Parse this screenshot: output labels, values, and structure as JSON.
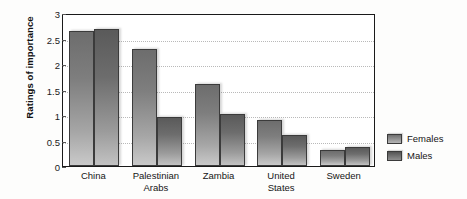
{
  "chart_data": {
    "type": "bar",
    "title": "",
    "xlabel": "",
    "ylabel": "Ratings of importance",
    "ylim": [
      0,
      3
    ],
    "yticks": [
      "0",
      "0.5",
      "1",
      "1.5",
      "2",
      "2.5",
      "3"
    ],
    "ytick_values": [
      0,
      0.5,
      1,
      1.5,
      2,
      2.5,
      3
    ],
    "grid": true,
    "legend_position": "right",
    "categories": [
      "China",
      "Palestinian Arabs",
      "Zambia",
      "United States",
      "Sweden"
    ],
    "category_lines": [
      [
        "China"
      ],
      [
        "Palestinian",
        "Arabs"
      ],
      [
        "Zambia"
      ],
      [
        "United",
        "States"
      ],
      [
        "Sweden"
      ]
    ],
    "series": [
      {
        "name": "Females",
        "color": "#7e7e7e",
        "values": [
          2.65,
          2.3,
          1.6,
          0.9,
          0.31
        ]
      },
      {
        "name": "Males",
        "color": "#5d5d5d",
        "values": [
          2.69,
          0.96,
          1.02,
          0.61,
          0.37
        ]
      }
    ]
  },
  "legend": {
    "items": [
      {
        "label": "Females"
      },
      {
        "label": "Males"
      }
    ]
  }
}
